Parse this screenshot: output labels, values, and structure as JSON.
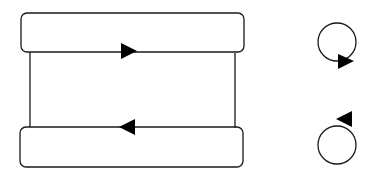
{
  "diagram": {
    "stroke_color": "#1a1a1a",
    "fill_color": "#ffffff",
    "arrow_color": "#000000",
    "top_box": {
      "x": 21,
      "y": 13,
      "width": 223,
      "height": 39,
      "rx": 6
    },
    "bottom_box": {
      "x": 20,
      "y": 127,
      "width": 223,
      "height": 40,
      "rx": 6
    },
    "left_connector": {
      "x": 30,
      "y1": 52,
      "y2": 127
    },
    "right_connector": {
      "x": 235,
      "y1": 52,
      "y2": 127
    },
    "top_arrow": {
      "direction": "right",
      "x": 129,
      "y": 51
    },
    "bottom_arrow": {
      "direction": "left",
      "x": 127,
      "y": 127
    },
    "clockwise_loop": {
      "cx": 337,
      "cy": 42,
      "r": 19,
      "arrow_direction": "right"
    },
    "counterclockwise_loop": {
      "cx": 337,
      "cy": 145,
      "r": 19,
      "arrow_direction": "left"
    }
  }
}
